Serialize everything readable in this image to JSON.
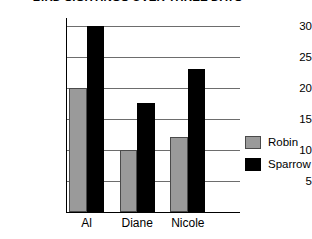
{
  "chart_data": {
    "type": "bar",
    "title": "BIRD SIGHTINGS OVER THREE DAYS",
    "xlabel": "",
    "ylabel": "",
    "categories": [
      "Al",
      "Diane",
      "Nicole"
    ],
    "series": [
      {
        "name": "Robin",
        "color": "#9a9a9a",
        "values": [
          20,
          10,
          12
        ]
      },
      {
        "name": "Sparrow",
        "color": "#000000",
        "values": [
          30,
          17.5,
          23
        ]
      }
    ],
    "ylim": [
      0,
      30
    ],
    "yticks": [
      5,
      10,
      15,
      20,
      25,
      30
    ],
    "ytick_labels": [
      "5",
      "10",
      "15",
      "20",
      "25",
      "30"
    ],
    "grid": true,
    "legend_position": "right"
  },
  "legend": {
    "entries": [
      {
        "label": "Robin"
      },
      {
        "label": "Sparrow"
      }
    ]
  }
}
